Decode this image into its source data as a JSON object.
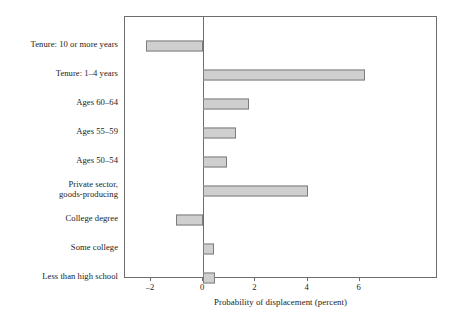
{
  "chart_data": {
    "type": "bar",
    "orientation": "horizontal",
    "title": "",
    "xlabel": "Probability of displacement (percent)",
    "ylabel": "",
    "xlim": [
      -3.0,
      9.0
    ],
    "xticks": [
      -2,
      0,
      2,
      4,
      6
    ],
    "xtick_labels": [
      "–2",
      "0",
      "2",
      "4",
      "6"
    ],
    "grid": false,
    "legend": false,
    "zero_reference_line": 0,
    "categories": [
      "Tenure: 10 or more years",
      "Tenure: 1–4 years",
      "Ages 60–64",
      "Ages 55–59",
      "Ages 50–54",
      "Private sector,\ngoods-producing",
      "College degree",
      "Some college",
      "Less than high school"
    ],
    "values": [
      -2.2,
      6.2,
      1.75,
      1.25,
      0.9,
      4.0,
      -1.05,
      0.4,
      0.45
    ],
    "bar_fill_color": "#cfcfcf",
    "bar_edge_color": "#7d7d7d",
    "frame_color": "#6d6d6d"
  }
}
